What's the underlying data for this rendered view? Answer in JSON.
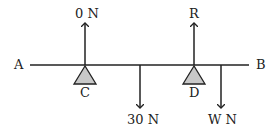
{
  "diagram": {
    "points": {
      "A": "A",
      "B": "B",
      "C": "C",
      "D": "D"
    },
    "forces": {
      "up_at_C": "0 N",
      "up_at_D": "R",
      "down_mid": "30 N",
      "down_right": "W N"
    },
    "colors": {
      "line": "#222222",
      "support_fill": "#c8c8c8"
    }
  }
}
